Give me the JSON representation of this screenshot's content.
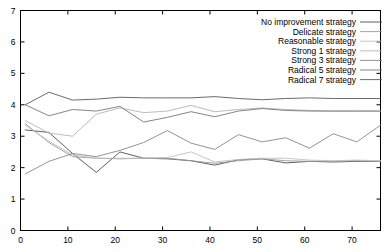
{
  "chart_data": {
    "type": "line",
    "title": "",
    "xlabel": "",
    "ylabel": "",
    "xlim": [
      0,
      76
    ],
    "ylim": [
      0,
      7
    ],
    "xticks": [
      0,
      10,
      20,
      30,
      40,
      50,
      60,
      70
    ],
    "yticks": [
      0,
      1,
      2,
      3,
      4,
      5,
      6,
      7
    ],
    "grid": false,
    "legend_position": "top-right",
    "x": [
      1,
      6,
      11,
      16,
      21,
      26,
      31,
      36,
      41,
      46,
      51,
      56,
      61,
      66,
      71,
      76
    ],
    "series": [
      {
        "name": "No improvement strategy",
        "color": "#4d4d4d",
        "values": [
          3.2,
          3.12,
          2.45,
          1.85,
          2.5,
          2.3,
          2.28,
          2.22,
          2.08,
          2.25,
          2.28,
          2.15,
          2.2,
          2.18,
          2.2,
          2.2
        ]
      },
      {
        "name": "Delicate strategy",
        "color": "#9a9a9a",
        "values": [
          3.4,
          2.8,
          2.35,
          2.3,
          2.28,
          2.3,
          2.3,
          2.22,
          2.14,
          2.22,
          2.28,
          2.22,
          2.2,
          2.2,
          2.22,
          2.2
        ]
      },
      {
        "name": "Reasonable strategy",
        "color": "#c0c0c0",
        "values": [
          3.35,
          2.85,
          2.4,
          2.3,
          2.3,
          2.3,
          2.32,
          2.5,
          2.18,
          2.26,
          2.3,
          2.3,
          2.24,
          2.22,
          2.24,
          2.22
        ]
      },
      {
        "name": "Strong 1 strategy",
        "color": "#b4b4b4",
        "values": [
          3.5,
          3.1,
          3.0,
          3.7,
          3.9,
          3.75,
          3.8,
          3.98,
          3.78,
          3.85,
          3.9,
          3.85,
          3.82,
          3.8,
          3.8,
          3.8
        ]
      },
      {
        "name": "Strong 3 strategy",
        "color": "#888888",
        "values": [
          1.8,
          2.2,
          2.45,
          2.35,
          2.55,
          2.8,
          3.18,
          2.78,
          2.58,
          3.05,
          2.82,
          2.95,
          2.62,
          3.08,
          2.82,
          3.35
        ]
      },
      {
        "name": "Radical 5 strategy",
        "color": "#777777",
        "values": [
          4.0,
          3.65,
          3.85,
          3.8,
          3.95,
          3.45,
          3.6,
          3.78,
          3.62,
          3.8,
          3.88,
          3.82,
          3.8,
          3.8,
          3.8,
          3.8
        ]
      },
      {
        "name": "Radical 7 strategy",
        "color": "#5a5a5a",
        "values": [
          4.0,
          4.4,
          4.15,
          4.18,
          4.24,
          4.22,
          4.22,
          4.22,
          4.26,
          4.2,
          4.16,
          4.2,
          4.22,
          4.2,
          4.2,
          4.2
        ]
      }
    ]
  },
  "legend": {
    "entries": [
      "No improvement strategy",
      "Delicate strategy",
      "Reasonable strategy",
      "Strong 1 strategy",
      "Strong 3 strategy",
      "Radical 5 strategy",
      "Radical 7 strategy"
    ]
  },
  "axes": {
    "x_tick_labels": [
      "0",
      "10",
      "20",
      "30",
      "40",
      "50",
      "60",
      "70"
    ],
    "y_tick_labels": [
      "0",
      "1",
      "2",
      "3",
      "4",
      "5",
      "6",
      "7"
    ]
  }
}
